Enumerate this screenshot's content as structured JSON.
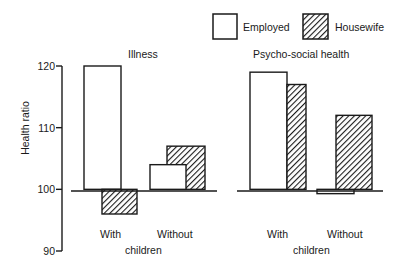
{
  "chart_data": {
    "type": "bar",
    "ylabel": "Health ratio",
    "xlabel": "children",
    "ylim": [
      90,
      120
    ],
    "yticks": [
      90,
      100,
      110,
      120
    ],
    "baseline": 100,
    "grid": false,
    "legend": {
      "position": "top-right",
      "entries": [
        {
          "name": "Employed",
          "style": "open"
        },
        {
          "name": "Housewife",
          "style": "hatched"
        }
      ]
    },
    "panels": [
      {
        "title": "Illness",
        "categories": [
          "With",
          "Without"
        ],
        "series": [
          {
            "name": "Employed",
            "values": [
              120,
              104
            ]
          },
          {
            "name": "Housewife",
            "values": [
              96,
              107
            ]
          }
        ]
      },
      {
        "title": "Psycho-social health",
        "categories": [
          "With",
          "Without"
        ],
        "series": [
          {
            "name": "Employed",
            "values": [
              119,
              99.3
            ]
          },
          {
            "name": "Housewife",
            "values": [
              117,
              112
            ]
          }
        ]
      }
    ]
  },
  "colors": {
    "line": "#1a1a1a",
    "fill_open": "#ffffff",
    "hatch": "#1a1a1a"
  }
}
